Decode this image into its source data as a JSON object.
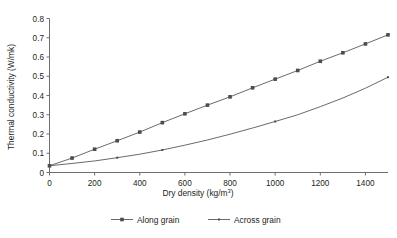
{
  "chart_data": {
    "type": "line",
    "title": "",
    "subtitle": "",
    "xlabel": "Dry density (kg/m3)",
    "xlabel_base": "Dry density (kg/m",
    "xlabel_sup": "3",
    "xlabel_tail": ")",
    "ylabel": "Thermal conductivity (W/mk)",
    "xlim": [
      0,
      1500
    ],
    "ylim": [
      0,
      0.8
    ],
    "xticks": [
      0,
      200,
      400,
      600,
      800,
      1000,
      1200,
      1400
    ],
    "xtick_labels": [
      "0",
      "200",
      "400",
      "600",
      "800",
      "1000",
      "1200",
      "1400"
    ],
    "yticks": [
      0,
      0.1,
      0.2,
      0.3,
      0.4,
      0.5,
      0.6,
      0.7,
      0.8
    ],
    "ytick_labels": [
      "0",
      "0.1",
      "0.2",
      "0.3",
      "0.4",
      "0.5",
      "0.6",
      "0.7",
      "0.8"
    ],
    "grid": false,
    "legend_position": "bottom",
    "x": [
      0,
      100,
      200,
      300,
      400,
      500,
      600,
      700,
      800,
      900,
      1000,
      1100,
      1200,
      1300,
      1400,
      1500
    ],
    "series": [
      {
        "name": "Along grain",
        "marker": "square",
        "markers_at": [
          0,
          100,
          200,
          300,
          400,
          500,
          600,
          700,
          800,
          900,
          1000,
          1100,
          1200,
          1300,
          1400,
          1500
        ],
        "values": [
          0.035,
          0.075,
          0.121,
          0.165,
          0.21,
          0.259,
          0.305,
          0.35,
          0.393,
          0.44,
          0.485,
          0.53,
          0.578,
          0.622,
          0.668,
          0.715
        ],
        "color": "#58595b"
      },
      {
        "name": "Across grain",
        "marker": "dot",
        "markers_at": [
          300,
          500,
          1000,
          1500
        ],
        "values": [
          0.035,
          0.047,
          0.06,
          0.077,
          0.095,
          0.117,
          0.142,
          0.169,
          0.199,
          0.231,
          0.265,
          0.3,
          0.342,
          0.387,
          0.438,
          0.495
        ],
        "color": "#58595b"
      }
    ]
  },
  "legend": {
    "items": [
      {
        "label": "Along grain"
      },
      {
        "label": "Across grain"
      }
    ]
  },
  "colors": {
    "axis": "#6d6e71",
    "line": "#58595b",
    "marker": "#4c4c4e",
    "text": "#231f20",
    "background": "#ffffff"
  }
}
